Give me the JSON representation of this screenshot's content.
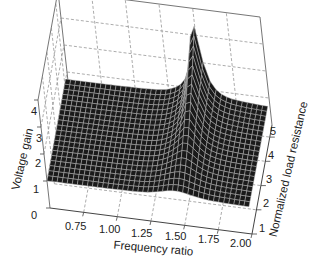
{
  "chart_data": {
    "type": "surface",
    "title": "",
    "xlabel": "Frequency ratio",
    "ylabel": "Normalized load resistance",
    "zlabel": "Voltage gain",
    "x_ticks": [
      "0.75",
      "1.00",
      "1.25",
      "1.50",
      "1.75",
      "2.00"
    ],
    "y_ticks": [
      "1",
      "2",
      "3",
      "4",
      "5"
    ],
    "z_ticks": [
      "0",
      "1",
      "2",
      "3",
      "4"
    ],
    "xlim": [
      0.5,
      2.0
    ],
    "ylim": [
      1,
      5.5
    ],
    "zlim": [
      0,
      4
    ],
    "grid": true,
    "grid_style": "dashed",
    "surface_color": "#1a1a1a",
    "mesh_color": "#bdbdbd"
  },
  "labels": {
    "x_title": "Frequency ratio",
    "y_title": "Normalized load resistance",
    "z_title": "Voltage gain"
  }
}
